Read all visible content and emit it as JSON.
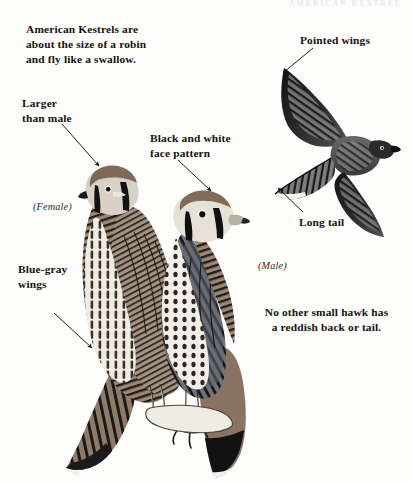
{
  "page": {
    "running_head": "AMERICAN KESTREL",
    "background": "#fdfdfb",
    "ink": "#14110f",
    "width": 412,
    "height": 482
  },
  "intro": {
    "text": "American Kestrels are\nabout the size of a robin\nand fly like a swallow."
  },
  "annotations": [
    {
      "id": "larger",
      "text": "Larger\nthan male"
    },
    {
      "id": "face",
      "text": "Black and white\nface pattern"
    },
    {
      "id": "bluegray",
      "text": "Blue-gray\nwings"
    },
    {
      "id": "pointed",
      "text": "Pointed wings"
    },
    {
      "id": "longtail",
      "text": "Long tail"
    }
  ],
  "sex_labels": {
    "female": "(Female)",
    "male": "(Male)"
  },
  "caption": {
    "text": "No other small hawk has\na reddish back or tail."
  },
  "illustrations": {
    "flying_bird": "american-kestrel-in-flight-underside",
    "perched_female": "american-kestrel-female-perched",
    "perched_male": "american-kestrel-male-perched"
  },
  "colors": {
    "rufous": "#8a7363",
    "blue_gray": "#6d6f73",
    "dark_ink": "#14110f",
    "paper": "#fdfdfb",
    "running_head": "#e8e8ee"
  }
}
